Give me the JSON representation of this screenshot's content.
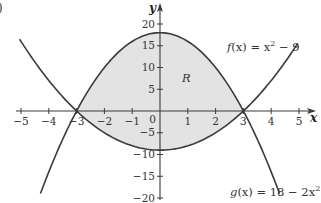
{
  "part_label": ")",
  "chart_data": {
    "type": "line",
    "title": "",
    "xlabel": "x",
    "ylabel": "y",
    "xlim": [
      -5,
      5
    ],
    "ylim": [
      -20,
      20
    ],
    "grid": false,
    "x_ticks": [
      -5,
      -4,
      -3,
      -2,
      -1,
      0,
      1,
      2,
      3,
      4,
      5
    ],
    "x_tick_labels": [
      "−5",
      "−4",
      "−3",
      "−2",
      "−1",
      "0",
      "1",
      "2",
      "3",
      "4",
      "5"
    ],
    "y_ticks": [
      20,
      15,
      10,
      5,
      -5,
      -10,
      -15,
      -20
    ],
    "y_tick_labels": [
      "20",
      "15",
      "10",
      "5",
      "−5",
      "−10",
      "−15",
      "−20"
    ],
    "series": [
      {
        "name": "f(x) = x² − 9",
        "expression": "x^2 - 9",
        "x": [
          -5,
          -4,
          -3,
          -2,
          -1,
          0,
          1,
          2,
          3,
          4,
          5
        ],
        "values": [
          16,
          7,
          0,
          -5,
          -8,
          -9,
          -8,
          -5,
          0,
          7,
          16
        ]
      },
      {
        "name": "g(x) = 18 − 2x²",
        "expression": "18 - 2x^2",
        "x": [
          -4.3,
          -4,
          -3,
          -2,
          -1,
          0,
          1,
          2,
          3,
          4,
          4.3
        ],
        "values": [
          -18.98,
          -14,
          0,
          10,
          16,
          18,
          16,
          10,
          0,
          -14,
          -18.98
        ]
      }
    ],
    "intersections": [
      [
        -3,
        0
      ],
      [
        3,
        0
      ]
    ],
    "shaded_region": {
      "label": "R",
      "between": [
        "g(x) = 18 − 2x²",
        "f(x) = x² − 9"
      ],
      "x_range": [
        -3,
        3
      ],
      "color": "#e3e3e3"
    },
    "annotations": [
      {
        "text": "R",
        "x": 0.9,
        "y": 7
      },
      {
        "text": "f(x) = x² − 9",
        "position": "upper right"
      },
      {
        "text": "g(x) = 18 − 2x²",
        "position": "lower right"
      }
    ],
    "colors": {
      "curve": "#3a3a3a",
      "axis": "#3a3a3a",
      "fill": "#e3e3e3"
    }
  },
  "labels": {
    "x_axis": "x",
    "y_axis": "y",
    "region": "R",
    "f_name": "f",
    "f_arg": "(x) = x",
    "f_exp": "2",
    "f_tail": " − 9",
    "g_name": "g",
    "g_arg": "(x) = 18 − 2x",
    "g_exp": "2"
  }
}
